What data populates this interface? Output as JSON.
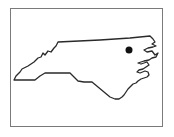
{
  "map": {
    "region": "North Carolina",
    "outline_color": "#2a2a2a",
    "frame_color": "#7a7a7a",
    "marker": {
      "label": "",
      "color": "#111111",
      "x": 129,
      "y": 50,
      "r": 3.5
    }
  }
}
